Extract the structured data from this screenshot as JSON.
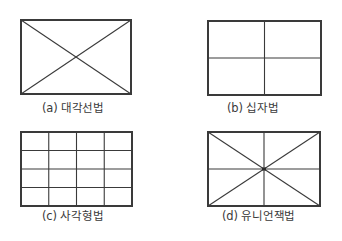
{
  "figures": [
    {
      "id": "a",
      "caption": "(a) 대각선법",
      "method": "diagonal",
      "rect": {
        "x": 21,
        "y": 20,
        "w": 110,
        "h": 74
      },
      "caption_pos": {
        "x": 42,
        "y": 102
      }
    },
    {
      "id": "b",
      "caption": "(b) 십자법",
      "method": "cross",
      "rect": {
        "x": 208,
        "y": 21,
        "w": 113,
        "h": 74
      },
      "caption_pos": {
        "x": 227,
        "y": 102
      }
    },
    {
      "id": "c",
      "caption": "(c) 사각형법",
      "method": "grid",
      "grid": {
        "cols": 4,
        "rows": 4
      },
      "rect": {
        "x": 21,
        "y": 132,
        "w": 111,
        "h": 74
      },
      "caption_pos": {
        "x": 42,
        "y": 210
      }
    },
    {
      "id": "d",
      "caption": "(d) 유니언잭법",
      "method": "union-jack",
      "rect": {
        "x": 208,
        "y": 132,
        "w": 112,
        "h": 74
      },
      "caption_pos": {
        "x": 222,
        "y": 210
      }
    }
  ],
  "style": {
    "line_color": "#3a3a3a",
    "outer_stroke": 2,
    "inner_stroke": 1.1
  }
}
